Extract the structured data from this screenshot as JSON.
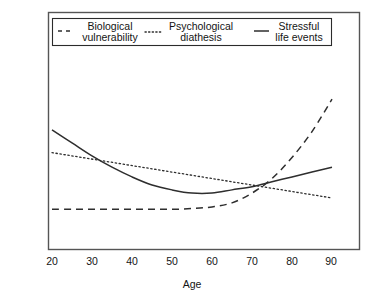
{
  "chart_data": {
    "type": "line",
    "title": "",
    "xlabel": "Age",
    "ylabel": "",
    "xlim": [
      20,
      90
    ],
    "ylim": [
      0,
      100
    ],
    "grid": false,
    "legend_position": "top",
    "xticks": [
      "20",
      "30",
      "40",
      "50",
      "60",
      "70",
      "80",
      "90"
    ],
    "xtick_values": [
      20,
      30,
      40,
      50,
      60,
      70,
      80,
      90
    ],
    "yticks": [],
    "x": [
      20,
      25,
      30,
      35,
      40,
      45,
      50,
      55,
      60,
      65,
      70,
      75,
      80,
      85,
      90
    ],
    "series": [
      {
        "name": "Biological vulnerability",
        "label_line1": "Biological",
        "label_line2": "vulnerability",
        "style": "dashed",
        "color": "#2e2e2e",
        "values": [
          14,
          14,
          14,
          14,
          14,
          14,
          14,
          14.5,
          15.5,
          18,
          24,
          33,
          46,
          62,
          82
        ]
      },
      {
        "name": "Psychological diathesis",
        "label_line1": "Psychological",
        "label_line2": "diathesis",
        "style": "dotted",
        "color": "#2e2e2e",
        "values": [
          49,
          47,
          45,
          43,
          41,
          39,
          37,
          35,
          33,
          31,
          29,
          27,
          25,
          23,
          21
        ]
      },
      {
        "name": "Stressful life events",
        "label_line1": "Stressful",
        "label_line2": "life events",
        "style": "solid",
        "color": "#2e2e2e",
        "values": [
          63,
          55,
          47,
          40,
          34,
          29,
          26,
          24,
          24,
          26,
          28,
          31,
          34,
          37,
          40
        ]
      }
    ]
  },
  "legend": {
    "items": [
      {
        "line1": "Biological",
        "line2": "vulnerability",
        "sample": "dashed-line-sample"
      },
      {
        "line1": "Psychological",
        "line2": "diathesis",
        "sample": "dotted-line-sample"
      },
      {
        "line1": "Stressful",
        "line2": "life events",
        "sample": "solid-line-sample"
      }
    ]
  },
  "axis": {
    "x_title": "Age",
    "x_tick_labels": [
      "20",
      "30",
      "40",
      "50",
      "60",
      "70",
      "80",
      "90"
    ]
  },
  "colors": {
    "line": "#2e2e2e",
    "frame": "#555555",
    "legend_border": "#2b2b2b",
    "background": "#ffffff",
    "text": "#141414"
  }
}
